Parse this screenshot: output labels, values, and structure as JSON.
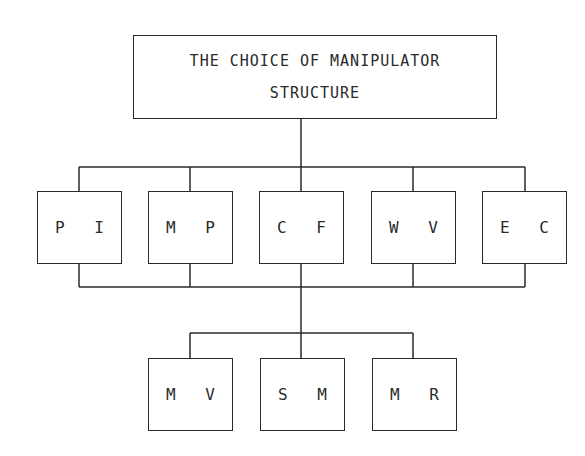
{
  "diagram": {
    "title_lines": [
      "THE CHOICE OF MANIPULATOR",
      "STRUCTURE"
    ],
    "level1": [
      {
        "id": "PI",
        "label": "P I"
      },
      {
        "id": "MP",
        "label": "M P"
      },
      {
        "id": "CF",
        "label": "C F"
      },
      {
        "id": "WV",
        "label": "W V"
      },
      {
        "id": "EC",
        "label": "E C"
      }
    ],
    "level2": [
      {
        "id": "MV",
        "label": "M V"
      },
      {
        "id": "SM",
        "label": "S M"
      },
      {
        "id": "MR",
        "label": "M R"
      }
    ],
    "colors": {
      "line": "#2a2a2a",
      "background": "#ffffff"
    }
  }
}
